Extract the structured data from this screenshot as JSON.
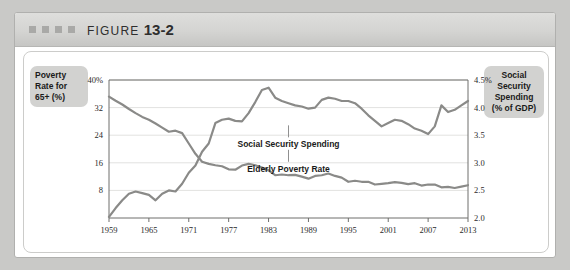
{
  "header": {
    "figure_word": "FIGURE",
    "figure_number": "13-2",
    "square_count": 4
  },
  "left_axis_label": "Poverty Rate for 65+ (%)",
  "right_axis_label": "Social Security Spending (% of GDP)",
  "colors": {
    "line": "#8a8a88",
    "grid": "#e2e2e0",
    "axis": "#6f6f6d",
    "page_background": "#c9c9c7",
    "header_background": "#d4d4d2",
    "label_box": "#d2d2d0"
  },
  "chart_data": {
    "type": "line",
    "title": "FIGURE 13-2",
    "xlabel": "",
    "ylabel": "Poverty Rate for 65+ (%)",
    "y2label": "Social Security Spending (% of GDP)",
    "grid": true,
    "legend": "inline-annotations",
    "xlim": [
      1959,
      2013
    ],
    "ylim": [
      0,
      40
    ],
    "y2lim": [
      2.0,
      4.5
    ],
    "xticks": [
      1959,
      1965,
      1971,
      1977,
      1983,
      1989,
      1995,
      2001,
      2007,
      2013
    ],
    "xticklabels": [
      "1959",
      "1965",
      "1971",
      "1977",
      "1983",
      "1989",
      "1995",
      "2001",
      "2007",
      "2013"
    ],
    "yticks": [
      8,
      16,
      24,
      32,
      40
    ],
    "yticklabels": [
      "8",
      "16",
      "24",
      "32",
      "40%"
    ],
    "y2ticks": [
      2.0,
      2.5,
      3.0,
      3.5,
      4.0,
      4.5
    ],
    "y2ticklabels": [
      "2.0",
      "2.5",
      "3.0",
      "3.5",
      "4.0",
      "4.5%"
    ],
    "annotations": [
      {
        "text": "Social Security Spending",
        "x": 1986,
        "y2": 3.28
      },
      {
        "text": "Elderly Poverty Rate",
        "x": 1986,
        "y": 13.4
      }
    ],
    "series": [
      {
        "name": "Elderly Poverty Rate",
        "axis": "left",
        "x": [
          1959,
          1960,
          1961,
          1962,
          1963,
          1964,
          1965,
          1966,
          1967,
          1968,
          1969,
          1970,
          1971,
          1972,
          1973,
          1974,
          1975,
          1976,
          1977,
          1978,
          1979,
          1980,
          1981,
          1982,
          1983,
          1984,
          1985,
          1986,
          1987,
          1988,
          1989,
          1990,
          1991,
          1992,
          1993,
          1994,
          1995,
          1996,
          1997,
          1998,
          1999,
          2000,
          2001,
          2002,
          2003,
          2004,
          2005,
          2006,
          2007,
          2008,
          2009,
          2010,
          2011,
          2012,
          2013
        ],
        "values": [
          35.2,
          34.0,
          32.9,
          31.6,
          30.4,
          29.3,
          28.5,
          27.4,
          26.2,
          25.0,
          25.3,
          24.6,
          21.6,
          18.6,
          16.3,
          15.7,
          15.3,
          15.0,
          14.1,
          14.0,
          15.2,
          15.7,
          15.3,
          14.6,
          13.8,
          12.4,
          12.6,
          12.4,
          12.5,
          12.0,
          11.4,
          12.2,
          12.4,
          12.9,
          12.2,
          11.7,
          10.5,
          10.8,
          10.5,
          10.5,
          9.7,
          9.9,
          10.1,
          10.4,
          10.2,
          9.8,
          10.1,
          9.4,
          9.7,
          9.7,
          8.9,
          9.0,
          8.7,
          9.1,
          9.5
        ]
      },
      {
        "name": "Social Security Spending",
        "axis": "right",
        "x": [
          1959,
          1960,
          1961,
          1962,
          1963,
          1964,
          1965,
          1966,
          1967,
          1968,
          1969,
          1970,
          1971,
          1972,
          1973,
          1974,
          1975,
          1976,
          1977,
          1978,
          1979,
          1980,
          1981,
          1982,
          1983,
          1984,
          1985,
          1986,
          1987,
          1988,
          1989,
          1990,
          1991,
          1992,
          1993,
          1994,
          1995,
          1996,
          1997,
          1998,
          1999,
          2000,
          2001,
          2002,
          2003,
          2004,
          2005,
          2006,
          2007,
          2008,
          2009,
          2010,
          2011,
          2012,
          2013
        ],
        "values": [
          2.02,
          2.18,
          2.32,
          2.44,
          2.48,
          2.45,
          2.42,
          2.32,
          2.44,
          2.5,
          2.48,
          2.62,
          2.82,
          2.95,
          3.2,
          3.35,
          3.72,
          3.78,
          3.8,
          3.76,
          3.75,
          3.9,
          4.1,
          4.32,
          4.36,
          4.18,
          4.12,
          4.08,
          4.04,
          4.02,
          3.98,
          4.0,
          4.14,
          4.18,
          4.16,
          4.12,
          4.12,
          4.08,
          3.98,
          3.86,
          3.76,
          3.66,
          3.72,
          3.78,
          3.76,
          3.7,
          3.62,
          3.58,
          3.52,
          3.66,
          4.04,
          3.92,
          3.96,
          4.04,
          4.12
        ]
      }
    ]
  }
}
